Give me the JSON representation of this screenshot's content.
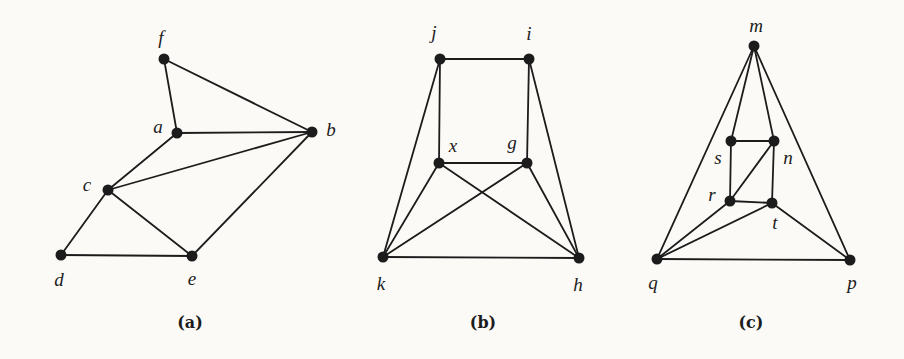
{
  "figure": {
    "width": 904,
    "height": 359,
    "paper_color": "#fbfaf7",
    "ink_color": "#1c1c1c",
    "dot_radius": 5.5,
    "line_width": 1.8,
    "graphs": [
      {
        "id": "a",
        "caption": "(a)",
        "caption_x": 190,
        "caption_y": 322,
        "vertices": [
          {
            "name": "f",
            "x": 164,
            "y": 59,
            "lx": 161,
            "ly": 37
          },
          {
            "name": "a",
            "x": 177,
            "y": 133,
            "lx": 158,
            "ly": 126
          },
          {
            "name": "b",
            "x": 312,
            "y": 132,
            "lx": 331,
            "ly": 129
          },
          {
            "name": "c",
            "x": 108,
            "y": 190,
            "lx": 87,
            "ly": 184
          },
          {
            "name": "d",
            "x": 61,
            "y": 255,
            "lx": 59,
            "ly": 279
          },
          {
            "name": "e",
            "x": 192,
            "y": 256,
            "lx": 192,
            "ly": 278
          }
        ],
        "edges": [
          [
            "f",
            "a"
          ],
          [
            "f",
            "b"
          ],
          [
            "a",
            "b"
          ],
          [
            "a",
            "c"
          ],
          [
            "c",
            "b"
          ],
          [
            "c",
            "d"
          ],
          [
            "c",
            "e"
          ],
          [
            "d",
            "e"
          ],
          [
            "e",
            "b"
          ]
        ]
      },
      {
        "id": "b",
        "caption": "(b)",
        "caption_x": 483,
        "caption_y": 322,
        "vertices": [
          {
            "name": "j",
            "x": 440,
            "y": 59,
            "lx": 434,
            "ly": 32
          },
          {
            "name": "i",
            "x": 529,
            "y": 59,
            "lx": 529,
            "ly": 33
          },
          {
            "name": "x",
            "x": 439,
            "y": 163,
            "lx": 453,
            "ly": 145
          },
          {
            "name": "g",
            "x": 527,
            "y": 163,
            "lx": 512,
            "ly": 142
          },
          {
            "name": "k",
            "x": 383,
            "y": 257,
            "lx": 381,
            "ly": 283
          },
          {
            "name": "h",
            "x": 579,
            "y": 258,
            "lx": 578,
            "ly": 284
          }
        ],
        "edges": [
          [
            "j",
            "i"
          ],
          [
            "j",
            "x"
          ],
          [
            "j",
            "k"
          ],
          [
            "i",
            "g"
          ],
          [
            "i",
            "h"
          ],
          [
            "x",
            "g"
          ],
          [
            "x",
            "k"
          ],
          [
            "x",
            "h"
          ],
          [
            "g",
            "k"
          ],
          [
            "g",
            "h"
          ],
          [
            "k",
            "h"
          ]
        ]
      },
      {
        "id": "c",
        "caption": "(c)",
        "caption_x": 751,
        "caption_y": 322,
        "vertices": [
          {
            "name": "m",
            "x": 754,
            "y": 46,
            "lx": 756,
            "ly": 25
          },
          {
            "name": "s",
            "x": 731,
            "y": 141,
            "lx": 718,
            "ly": 157
          },
          {
            "name": "n",
            "x": 774,
            "y": 141,
            "lx": 788,
            "ly": 157
          },
          {
            "name": "r",
            "x": 730,
            "y": 201,
            "lx": 712,
            "ly": 194
          },
          {
            "name": "t",
            "x": 772,
            "y": 203,
            "lx": 775,
            "ly": 222
          },
          {
            "name": "q",
            "x": 657,
            "y": 259,
            "lx": 653,
            "ly": 282
          },
          {
            "name": "p",
            "x": 850,
            "y": 260,
            "lx": 852,
            "ly": 282
          }
        ],
        "edges": [
          [
            "m",
            "q"
          ],
          [
            "m",
            "s"
          ],
          [
            "m",
            "n"
          ],
          [
            "m",
            "p"
          ],
          [
            "s",
            "n"
          ],
          [
            "s",
            "r"
          ],
          [
            "n",
            "t"
          ],
          [
            "n",
            "r"
          ],
          [
            "r",
            "t"
          ],
          [
            "q",
            "r"
          ],
          [
            "q",
            "t"
          ],
          [
            "q",
            "p"
          ],
          [
            "t",
            "p"
          ]
        ]
      }
    ]
  }
}
